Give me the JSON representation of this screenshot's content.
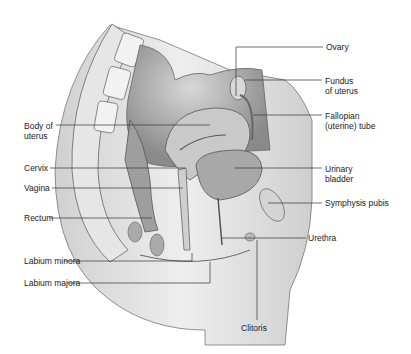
{
  "labels": {
    "ovary": "Ovary",
    "fundus": "Fundus\nof uterus",
    "fallopian": "Fallopian\n(uterine) tube",
    "body_uterus": "Body of\nuterus",
    "cervix": "Cervix",
    "vagina": "Vagina",
    "urinary_bladder": "Urinary\nbladder",
    "symphysis": "Symphysis pubis",
    "rectum": "Rectum",
    "urethra": "Urethra",
    "labium_minora": "Labium minora",
    "labium_majora": "Labium majora",
    "clitoris": "Clitoris"
  }
}
